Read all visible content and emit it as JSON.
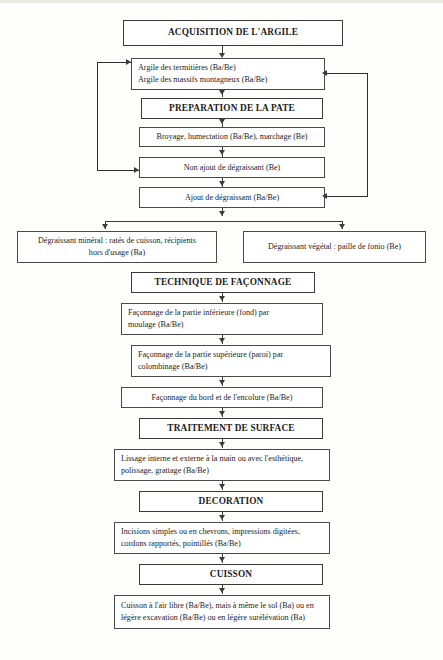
{
  "diagram": {
    "title": "ACQUISITION DE L'ARGILE",
    "language": "fr",
    "nodes": {
      "acquisition": {
        "label": "ACQUISITION DE L'ARGILE",
        "type": "section-heading"
      },
      "argile_sources": {
        "line1": "Argile des termitières (Ba/Be)",
        "line2": "Argile des massifs montagneux (Ba/Be)",
        "type": "process"
      },
      "preparation": {
        "label": "PREPARATION DE LA PATE",
        "type": "section-heading"
      },
      "broyage": {
        "line1": "Broyage, humectation (Ba/Be), marchage (Be)",
        "type": "process"
      },
      "non_ajout": {
        "line1": "Non ajout de dégraissant (Be)",
        "type": "process"
      },
      "ajout": {
        "line1": "Ajout de dégraissant (Ba/Be)",
        "type": "process"
      },
      "degraissant_mineral": {
        "line1": "Dégraissant minéral : ratés de cuisson, récipients",
        "line2": "hors d'usage (Ba)",
        "type": "process"
      },
      "degraissant_vegetal": {
        "line1": "Dégraissant végétal : paille de fonio  (Be)",
        "type": "process"
      },
      "technique_faconnage": {
        "label": "TECHNIQUE DE FAÇONNAGE",
        "type": "section-heading"
      },
      "faconnage_inferieure": {
        "line1": "Façonnage de la partie inférieure (fond) par",
        "line2": "moulage (Ba/Be)",
        "type": "process"
      },
      "faconnage_superieure": {
        "line1": "Façonnage de la partie supérieure (paroi) par",
        "line2": "colombinage (Ba/Be)",
        "type": "process"
      },
      "faconnage_bord": {
        "line1": "Façonnage du bord et de l'encolure (Ba/Be)",
        "type": "process"
      },
      "traitement_surface": {
        "label": "TRAITEMENT DE SURFACE",
        "type": "section-heading"
      },
      "lissage": {
        "line1": "Lissage interne et externe à la main ou avec l'esthétique,",
        "line2": "polissage, grattage (Ba/Be)",
        "type": "process"
      },
      "decoration": {
        "label": "DECORATION",
        "type": "section-heading"
      },
      "incisions": {
        "line1": "Incisions simples ou en chevrons, impressions digitées,",
        "line2": "cordons rapportés, pointillés (Ba/Be)",
        "type": "process"
      },
      "cuisson": {
        "label": "CUISSON",
        "type": "section-heading"
      },
      "cuisson_detail": {
        "line1": "Cuisson à l'air libre (Ba/Be), mais à même le sol (Ba) ou en",
        "line2": "légère excavation (Ba/Be) ou en légère surélévation (Ba)",
        "type": "process"
      }
    },
    "colors": {
      "background": "#fdfdfc",
      "box_border": "#4a4a4a",
      "box_fill": "#ffffff",
      "connector": "#3c3c3c",
      "text": "#1c1c1c"
    }
  }
}
